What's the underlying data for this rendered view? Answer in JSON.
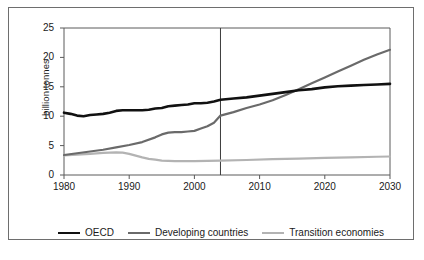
{
  "chart_data": {
    "type": "line",
    "title": "",
    "subtitle": "",
    "xlabel": "",
    "ylabel": "billion tonnes",
    "xlim": [
      1980,
      2030
    ],
    "ylim": [
      0,
      25
    ],
    "xticks": [
      "1980",
      "1990",
      "2000",
      "2010",
      "2020",
      "2030"
    ],
    "yticks": [
      "0",
      "5",
      "10",
      "15",
      "20",
      "25"
    ],
    "grid": false,
    "legend_position": "bottom",
    "annotations": [
      {
        "name": "projection-divider",
        "type": "vertical-line",
        "x": 2004,
        "label": ""
      }
    ],
    "series": [
      {
        "name": "OECD",
        "color": "#111111",
        "width": 2.6,
        "x": [
          1980,
          1981,
          1982,
          1983,
          1984,
          1985,
          1986,
          1987,
          1988,
          1989,
          1990,
          1991,
          1992,
          1993,
          1994,
          1995,
          1996,
          1997,
          1998,
          1999,
          2000,
          2001,
          2002,
          2003,
          2004,
          2006,
          2008,
          2010,
          2012,
          2014,
          2016,
          2018,
          2020,
          2022,
          2024,
          2026,
          2028,
          2030
        ],
        "values": [
          10.6,
          10.4,
          10.1,
          10.0,
          10.2,
          10.3,
          10.4,
          10.6,
          10.9,
          11.0,
          11.0,
          11.0,
          11.0,
          11.1,
          11.3,
          11.4,
          11.7,
          11.8,
          11.9,
          12.0,
          12.2,
          12.2,
          12.3,
          12.5,
          12.8,
          13.0,
          13.2,
          13.5,
          13.8,
          14.1,
          14.4,
          14.6,
          14.9,
          15.1,
          15.2,
          15.3,
          15.4,
          15.5
        ]
      },
      {
        "name": "Developing countries",
        "color": "#6a6a6a",
        "width": 2.2,
        "x": [
          1980,
          1982,
          1984,
          1986,
          1988,
          1990,
          1992,
          1994,
          1995,
          1996,
          1997,
          1998,
          1999,
          2000,
          2001,
          2002,
          2003,
          2004,
          2006,
          2008,
          2010,
          2012,
          2014,
          2016,
          2018,
          2020,
          2022,
          2024,
          2026,
          2028,
          2030
        ],
        "values": [
          3.4,
          3.7,
          4.0,
          4.3,
          4.7,
          5.1,
          5.6,
          6.4,
          6.9,
          7.2,
          7.3,
          7.3,
          7.4,
          7.5,
          7.9,
          8.3,
          8.9,
          10.1,
          10.7,
          11.4,
          12.0,
          12.7,
          13.6,
          14.6,
          15.6,
          16.6,
          17.6,
          18.6,
          19.6,
          20.5,
          21.3
        ]
      },
      {
        "name": "Transition economies",
        "color": "#b3b3b3",
        "width": 2.2,
        "x": [
          1980,
          1982,
          1984,
          1986,
          1988,
          1989,
          1990,
          1991,
          1992,
          1993,
          1994,
          1995,
          1996,
          1997,
          1998,
          2000,
          2002,
          2004,
          2008,
          2012,
          2016,
          2020,
          2024,
          2028,
          2030
        ],
        "values": [
          3.35,
          3.45,
          3.6,
          3.75,
          3.85,
          3.8,
          3.6,
          3.3,
          3.0,
          2.75,
          2.6,
          2.45,
          2.4,
          2.35,
          2.35,
          2.35,
          2.4,
          2.45,
          2.55,
          2.7,
          2.8,
          2.9,
          3.0,
          3.1,
          3.15
        ]
      }
    ]
  },
  "legend": {
    "items": [
      {
        "label": "OECD",
        "color": "#111111",
        "width": 2.6
      },
      {
        "label": "Developing countries",
        "color": "#6a6a6a",
        "width": 2.2
      },
      {
        "label": "Transition economies",
        "color": "#b3b3b3",
        "width": 2.2
      }
    ]
  },
  "axes": {
    "y_title": "billion tonnes"
  },
  "caption": {
    "text": ""
  },
  "colors": {
    "frame": "#6e6e6e",
    "axis": "#5a5a5a",
    "text": "#1a1a1a",
    "background": "#ffffff"
  }
}
